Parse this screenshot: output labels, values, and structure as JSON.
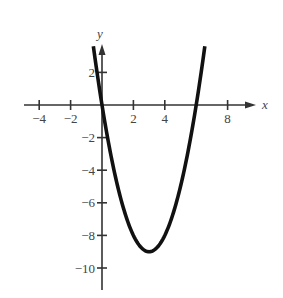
{
  "chart_data": {
    "type": "line",
    "title": "",
    "xlabel": "x",
    "ylabel": "y",
    "equation": "y = x^2 - 6x",
    "xlim": [
      -4.3,
      9.5
    ],
    "ylim": [
      -10.8,
      4.5
    ],
    "grid": false,
    "legend": null,
    "x_ticks": [
      -4,
      -2,
      2,
      4,
      8
    ],
    "x_tick_labels": [
      "−4",
      "−2",
      "2",
      "4",
      "8"
    ],
    "y_ticks": [
      2,
      -2,
      -4,
      -6,
      -8,
      -10
    ],
    "y_tick_labels": [
      "2",
      "−2",
      "−4",
      "−6",
      "−8",
      "−10"
    ],
    "series": [
      {
        "name": "parabola",
        "x_range": [
          -0.55,
          6.55
        ],
        "points": [
          [
            -0.5,
            3.25
          ],
          [
            0,
            0
          ],
          [
            1,
            -5
          ],
          [
            2,
            -8
          ],
          [
            3,
            -9
          ],
          [
            4,
            -8
          ],
          [
            5,
            -5
          ],
          [
            6,
            0
          ],
          [
            6.5,
            3.25
          ]
        ],
        "color": "#111111"
      }
    ],
    "annotations": {
      "x_intercepts": [
        0,
        6
      ],
      "vertex": [
        3,
        -9
      ]
    }
  },
  "colors": {
    "axis": "#333333",
    "curve": "#111111",
    "text": "#444444"
  }
}
